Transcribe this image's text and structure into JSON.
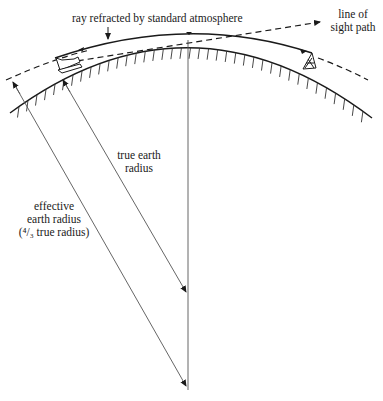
{
  "diagram": {
    "labels": {
      "ray": "ray refracted by standard atmosphere",
      "line_of_sight_1": "line of",
      "line_of_sight_2": "sight path",
      "true_radius_1": "true earth",
      "true_radius_2": "radius",
      "effective_1": "effective",
      "effective_2": "earth radius",
      "effective_3": "(⁴/₃ true radius)"
    },
    "elements": [
      {
        "id": "earth-surface",
        "type": "arc",
        "style": "solid-hatched"
      },
      {
        "id": "effective-earth-arc",
        "type": "arc",
        "style": "dashed"
      },
      {
        "id": "refracted-ray",
        "type": "arc",
        "style": "solid-arrowed"
      },
      {
        "id": "line-of-sight",
        "type": "line",
        "style": "dashed-arrow"
      },
      {
        "id": "ship",
        "type": "icon"
      },
      {
        "id": "target-tower",
        "type": "icon"
      },
      {
        "id": "true-radius-line",
        "type": "arrow"
      },
      {
        "id": "effective-radius-line",
        "type": "arrow"
      },
      {
        "id": "vertical-axis",
        "type": "line"
      }
    ],
    "colors": {
      "ink": "#1a1a1a",
      "thin": "#555555",
      "background": "#ffffff"
    }
  }
}
